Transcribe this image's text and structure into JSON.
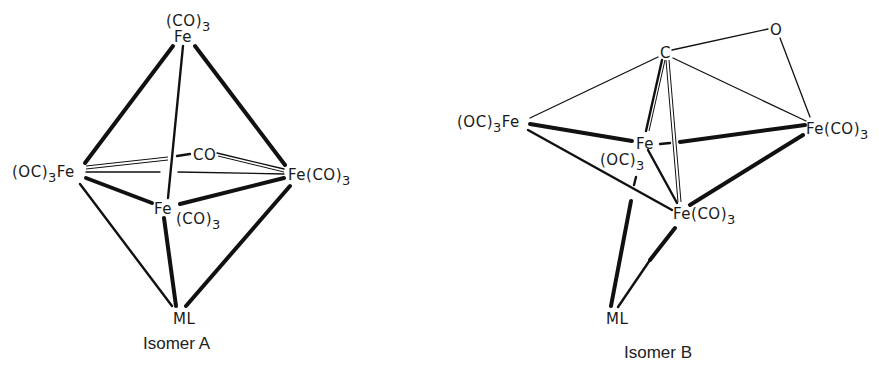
{
  "figure": {
    "isomer_a": {
      "caption": "Isomer A",
      "atoms": {
        "top_fe_ligand": "(CO)",
        "top_fe_ligand_sub": "3",
        "top_fe": "Fe",
        "left_fe_prefix": "(OC)",
        "left_fe_sub": "3",
        "left_fe": "Fe",
        "bridging_co": "CO",
        "right_fe": "Fe(CO)",
        "right_fe_sub": "3",
        "center_fe": "Fe",
        "center_fe_ligand": "(CO)",
        "center_fe_ligand_sub": "3",
        "ml": "ML"
      }
    },
    "isomer_b": {
      "caption": "Isomer B",
      "atoms": {
        "c": "C",
        "o": "O",
        "left_fe_prefix": "(OC)",
        "left_fe_sub": "3",
        "left_fe": "Fe",
        "center_fe": "Fe",
        "center_fe_ligand": "(OC)",
        "center_fe_ligand_sub": "3",
        "right_fe": "Fe(CO)",
        "right_fe_sub": "3",
        "bottom_fe": "Fe(CO)",
        "bottom_fe_sub": "3",
        "ml": "ML"
      }
    }
  }
}
